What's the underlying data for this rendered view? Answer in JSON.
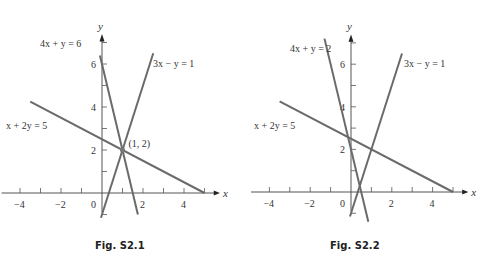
{
  "figures": [
    {
      "caption": "Fig. S2.1",
      "origin_px": [
        102,
        193
      ],
      "unit_px": [
        20.5,
        21.5
      ],
      "x_ticks": [
        "−4",
        "−2",
        "0",
        "2",
        "4"
      ],
      "y_ticks": [
        "2",
        "4",
        "6"
      ],
      "x_axis_label": "x",
      "y_axis_label": "y",
      "lines": [
        {
          "label": "4x + y = 6",
          "a": 4,
          "b": 1,
          "c": 6,
          "xrange": [
            -0.1,
            1.75
          ]
        },
        {
          "label": "3x − y = 1",
          "a": 3,
          "b": -1,
          "c": 1,
          "xrange": [
            -0.05,
            2.5
          ]
        },
        {
          "label": "x + 2y = 5",
          "a": 1,
          "b": 2,
          "c": 5,
          "xrange": [
            -3.5,
            5
          ]
        }
      ],
      "point": {
        "label": "(1, 2)",
        "x": 1,
        "y": 2
      }
    },
    {
      "caption": "Fig. S2.2",
      "origin_px": [
        351,
        192
      ],
      "unit_px": [
        20.4,
        21.3
      ],
      "x_ticks": [
        "−4",
        "−2",
        "0",
        "2",
        "4"
      ],
      "y_ticks": [
        "2",
        "4",
        "6"
      ],
      "x_axis_label": "x",
      "y_axis_label": "y",
      "lines": [
        {
          "label": "4x + y = 2",
          "a": 4,
          "b": 1,
          "c": 2,
          "xrange": [
            -1.3,
            0.85
          ]
        },
        {
          "label": "3x − y = 1",
          "a": 3,
          "b": -1,
          "c": 1,
          "xrange": [
            -0.05,
            2.5
          ]
        },
        {
          "label": "x + 2y = 5",
          "a": 1,
          "b": 2,
          "c": 5,
          "xrange": [
            -3.5,
            5
          ]
        }
      ]
    }
  ],
  "chart_data": [
    {
      "type": "line",
      "title": "Fig. S2.1",
      "xlabel": "x",
      "ylabel": "y",
      "xlim": [
        -4.5,
        5.5
      ],
      "ylim": [
        -1,
        7
      ],
      "series": [
        {
          "name": "4x + y = 6",
          "x": [
            -0.1,
            1.75
          ],
          "y": [
            6.4,
            -1
          ]
        },
        {
          "name": "3x − y = 1",
          "x": [
            0,
            2.5
          ],
          "y": [
            -1,
            6.5
          ]
        },
        {
          "name": "x + 2y = 5",
          "x": [
            -3.5,
            5
          ],
          "y": [
            4.25,
            0
          ]
        }
      ],
      "annotations": [
        {
          "text": "(1, 2)",
          "x": 1,
          "y": 2
        }
      ]
    },
    {
      "type": "line",
      "title": "Fig. S2.2",
      "xlabel": "x",
      "ylabel": "y",
      "xlim": [
        -4.5,
        5.5
      ],
      "ylim": [
        -1,
        7
      ],
      "series": [
        {
          "name": "4x + y = 2",
          "x": [
            -1.25,
            0.75
          ],
          "y": [
            7,
            -1
          ]
        },
        {
          "name": "3x − y = 1",
          "x": [
            0,
            2.5
          ],
          "y": [
            -1,
            6.5
          ]
        },
        {
          "name": "x + 2y = 5",
          "x": [
            -3.5,
            5
          ],
          "y": [
            4.25,
            0
          ]
        }
      ]
    }
  ]
}
